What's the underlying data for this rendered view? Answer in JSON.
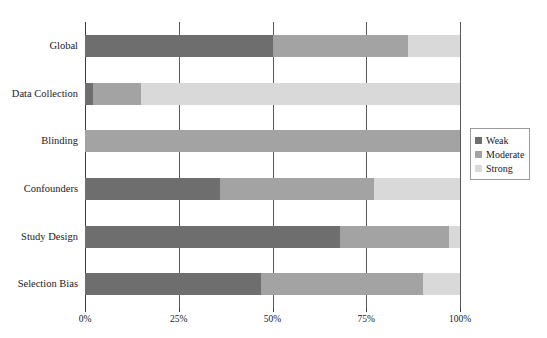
{
  "chart_data": {
    "type": "bar",
    "orientation": "horizontal",
    "stacked": true,
    "stack_mode": "percent",
    "title": "",
    "xlabel": "",
    "ylabel": "",
    "xlim": [
      0,
      100
    ],
    "xticks": [
      0,
      25,
      50,
      75,
      100
    ],
    "xtick_labels": [
      "0%",
      "25%",
      "50%",
      "75%",
      "100%"
    ],
    "grid": true,
    "grid_axis": "x",
    "legend_position": "right",
    "categories": [
      "Global",
      "Data Collection",
      "Blinding",
      "Confounders",
      "Study Design",
      "Selection Bias"
    ],
    "series": [
      {
        "name": "Weak",
        "color": "#6e6e6e",
        "values": [
          50,
          2,
          0,
          36,
          68,
          47
        ]
      },
      {
        "name": "Moderate",
        "color": "#a3a3a3",
        "values": [
          36,
          13,
          100,
          41,
          29,
          43
        ]
      },
      {
        "name": "Strong",
        "color": "#d9d9d9",
        "values": [
          14,
          85,
          0,
          23,
          3,
          10
        ]
      }
    ]
  },
  "legend": {
    "items": [
      {
        "label": "Weak",
        "color": "#6e6e6e"
      },
      {
        "label": "Moderate",
        "color": "#a3a3a3"
      },
      {
        "label": "Strong",
        "color": "#d9d9d9"
      }
    ]
  },
  "axis": {
    "tick_labels": [
      "0%",
      "25%",
      "50%",
      "75%",
      "100%"
    ]
  }
}
